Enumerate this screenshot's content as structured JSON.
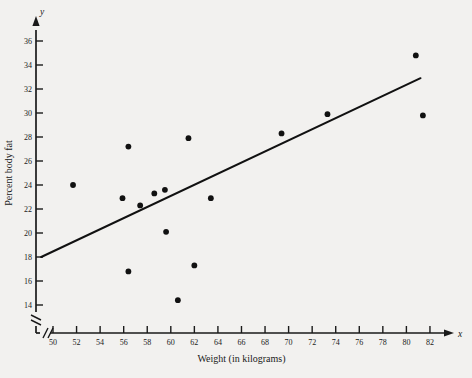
{
  "chart_data": {
    "type": "scatter",
    "title": "",
    "xlabel": "Weight (in kilograms)",
    "ylabel": "Percent body fat",
    "x_axis_variable": "x",
    "y_axis_variable": "y",
    "xlim": [
      49,
      83
    ],
    "ylim": [
      13,
      37.5
    ],
    "x_ticks": [
      50,
      52,
      54,
      56,
      58,
      60,
      62,
      64,
      66,
      68,
      70,
      72,
      74,
      76,
      78,
      80,
      82
    ],
    "y_ticks": [
      14,
      16,
      18,
      20,
      22,
      24,
      26,
      28,
      30,
      32,
      34,
      36
    ],
    "axis_break_x": true,
    "axis_break_y": true,
    "grid": false,
    "legend": null,
    "points": [
      {
        "x": 51.7,
        "y": 24.0
      },
      {
        "x": 56.4,
        "y": 27.2
      },
      {
        "x": 55.9,
        "y": 22.9
      },
      {
        "x": 57.4,
        "y": 22.3
      },
      {
        "x": 58.6,
        "y": 23.3
      },
      {
        "x": 59.5,
        "y": 23.6
      },
      {
        "x": 59.6,
        "y": 20.1
      },
      {
        "x": 56.4,
        "y": 16.8
      },
      {
        "x": 60.6,
        "y": 14.4
      },
      {
        "x": 62.0,
        "y": 17.3
      },
      {
        "x": 61.5,
        "y": 27.9
      },
      {
        "x": 63.4,
        "y": 22.9
      },
      {
        "x": 69.4,
        "y": 28.3
      },
      {
        "x": 73.3,
        "y": 29.9
      },
      {
        "x": 80.8,
        "y": 34.8
      },
      {
        "x": 81.4,
        "y": 29.8
      }
    ],
    "regression_line": {
      "x_start": 49.0,
      "y_start": 18.0,
      "x_end": 81.2,
      "y_end": 32.9
    },
    "point_color": "#111111",
    "line_color": "#111111",
    "background_color": "#f2f1ef"
  }
}
